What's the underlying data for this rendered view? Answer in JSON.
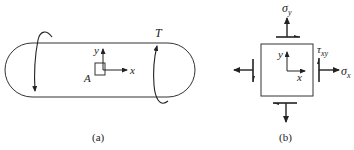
{
  "figure": {
    "panel_a": {
      "caption": "(a)",
      "torque_label": "T",
      "point_label": "A",
      "axis_x": "x",
      "axis_y": "y"
    },
    "panel_b": {
      "caption": "(b)",
      "sigma_y": "σ",
      "sigma_y_sub": "y",
      "sigma_x": "σ",
      "sigma_x_sub": "x",
      "tau": "τ",
      "tau_sub": "xy",
      "axis_x": "x",
      "axis_y": "y"
    },
    "colors": {
      "stroke": "#222222",
      "background": "#ffffff"
    }
  }
}
